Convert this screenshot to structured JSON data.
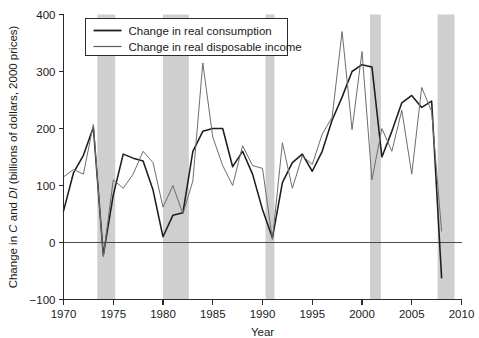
{
  "chart_data": {
    "type": "line",
    "title": "",
    "xlabel": "Year",
    "ylabel": "Change in C and DI (billions of dollars, 2000 prices)",
    "ylabel_plain": "Change in",
    "ylabel_italic_1": "C",
    "ylabel_mid": "and",
    "ylabel_italic_2": "DI",
    "ylabel_tail": "(billions of dollars, 2000 prices)",
    "xlim": [
      1970,
      2010
    ],
    "ylim": [
      -100,
      400
    ],
    "xticks": [
      1970,
      1975,
      1980,
      1985,
      1990,
      1995,
      2000,
      2005,
      2010
    ],
    "yticks": [
      -100,
      0,
      100,
      200,
      300,
      400
    ],
    "grid": false,
    "legend_position": "top-left",
    "zero_line": 0,
    "x": [
      1970,
      1971,
      1972,
      1973,
      1974,
      1975,
      1976,
      1977,
      1978,
      1979,
      1980,
      1981,
      1982,
      1983,
      1984,
      1985,
      1986,
      1987,
      1988,
      1989,
      1990,
      1991,
      1992,
      1993,
      1994,
      1995,
      1996,
      1997,
      1998,
      1999,
      2000,
      2001,
      2002,
      2003,
      2004,
      2005,
      2006,
      2007,
      2008
    ],
    "series": [
      {
        "name": "Change in real consumption",
        "color": "#1d1d1d",
        "values": [
          55,
          122,
          153,
          202,
          -22,
          83,
          155,
          148,
          143,
          92,
          10,
          48,
          52,
          160,
          195,
          200,
          200,
          133,
          160,
          120,
          58,
          8,
          105,
          140,
          155,
          125,
          160,
          215,
          255,
          300,
          312,
          308,
          150,
          195,
          245,
          258,
          237,
          248,
          -62
        ]
      },
      {
        "name": "Change in real disposable income",
        "color": "#6d6d6d",
        "values": [
          115,
          128,
          120,
          207,
          -25,
          110,
          95,
          120,
          160,
          140,
          62,
          100,
          50,
          108,
          315,
          185,
          135,
          100,
          170,
          135,
          130,
          5,
          175,
          95,
          152,
          137,
          190,
          220,
          370,
          198,
          335,
          110,
          200,
          160,
          232,
          120,
          272,
          230,
          20
        ]
      }
    ],
    "recessions": [
      {
        "start": 1973.4,
        "end": 1975.2
      },
      {
        "start": 1980.0,
        "end": 1982.6
      },
      {
        "start": 1990.3,
        "end": 1991.2
      },
      {
        "start": 2000.8,
        "end": 2001.9
      },
      {
        "start": 2007.6,
        "end": 2009.3
      }
    ]
  }
}
